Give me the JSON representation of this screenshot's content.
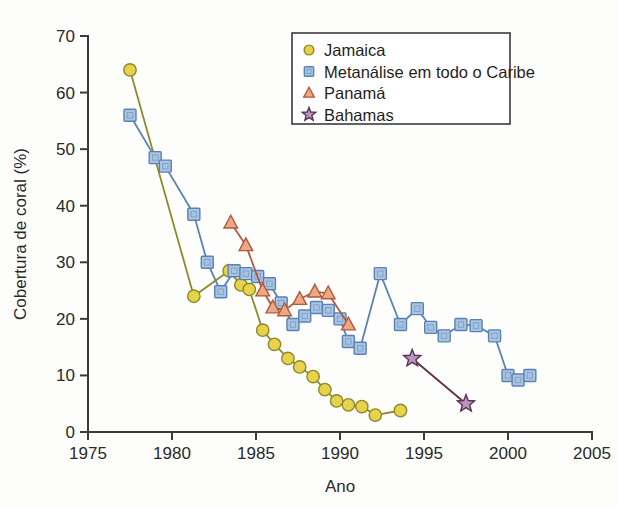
{
  "chart_data": {
    "type": "line",
    "title": "",
    "xlabel": "Ano",
    "ylabel": "Cobertura de coral (%)",
    "xlim": [
      1975,
      2005
    ],
    "ylim": [
      0,
      70
    ],
    "xticks": [
      1975,
      1980,
      1985,
      1990,
      1995,
      2000,
      2005
    ],
    "yticks": [
      0,
      10,
      20,
      30,
      40,
      50,
      60,
      70
    ],
    "grid": false,
    "legend_position": "top-right",
    "series": [
      {
        "name": "Jamaica",
        "marker": "circle",
        "color": "#e8d24a",
        "line_color": "#8d8a2a",
        "points": [
          [
            1977.5,
            64.0
          ],
          [
            1981.3,
            24.0
          ],
          [
            1983.4,
            28.5
          ],
          [
            1984.1,
            26.0
          ],
          [
            1984.6,
            25.2
          ],
          [
            1985.4,
            18.0
          ],
          [
            1986.1,
            15.5
          ],
          [
            1986.9,
            13.0
          ],
          [
            1987.6,
            11.5
          ],
          [
            1988.4,
            9.8
          ],
          [
            1989.1,
            7.5
          ],
          [
            1989.8,
            5.5
          ],
          [
            1990.5,
            4.8
          ],
          [
            1991.3,
            4.5
          ],
          [
            1992.1,
            3.0
          ],
          [
            1993.6,
            3.8
          ]
        ]
      },
      {
        "name": "Metanálise em todo o Caribe",
        "marker": "square",
        "color": "#a8c4e0",
        "line_color": "#5b82b5",
        "points": [
          [
            1977.5,
            56.0
          ],
          [
            1979.0,
            48.5
          ],
          [
            1979.6,
            47.0
          ],
          [
            1981.3,
            38.5
          ],
          [
            1982.1,
            30.0
          ],
          [
            1982.9,
            24.8
          ],
          [
            1983.7,
            28.5
          ],
          [
            1984.4,
            28.0
          ],
          [
            1985.1,
            27.5
          ],
          [
            1985.8,
            26.2
          ],
          [
            1986.5,
            22.8
          ],
          [
            1987.2,
            19.0
          ],
          [
            1987.9,
            20.5
          ],
          [
            1988.6,
            22.0
          ],
          [
            1989.3,
            21.5
          ],
          [
            1990.0,
            20.0
          ],
          [
            1990.5,
            16.0
          ],
          [
            1991.2,
            14.8
          ],
          [
            1992.4,
            28.0
          ],
          [
            1993.6,
            19.0
          ],
          [
            1994.6,
            21.8
          ],
          [
            1995.4,
            18.5
          ],
          [
            1996.2,
            17.0
          ],
          [
            1997.2,
            19.0
          ],
          [
            1998.1,
            18.8
          ],
          [
            1999.2,
            17.0
          ],
          [
            2000.0,
            10.0
          ],
          [
            2000.6,
            9.2
          ],
          [
            2001.3,
            10.0
          ]
        ]
      },
      {
        "name": "Panamá",
        "marker": "triangle",
        "color": "#eba882",
        "line_color": "#b0593f",
        "points": [
          [
            1983.5,
            37.0
          ],
          [
            1984.4,
            33.0
          ],
          [
            1985.4,
            25.0
          ],
          [
            1986.0,
            22.0
          ],
          [
            1986.7,
            21.5
          ],
          [
            1987.6,
            23.5
          ],
          [
            1988.5,
            24.8
          ],
          [
            1989.3,
            24.5
          ],
          [
            1990.5,
            19.0
          ]
        ]
      },
      {
        "name": "Bahamas",
        "marker": "star",
        "color": "#b697c0",
        "line_color": "#5b3250",
        "points": [
          [
            1994.3,
            13.0
          ],
          [
            1997.5,
            5.0
          ]
        ]
      }
    ]
  },
  "legend": {
    "entries": [
      {
        "label": "Jamaica"
      },
      {
        "label": "Metanálise em todo o Caribe"
      },
      {
        "label": "Panamá"
      },
      {
        "label": "Bahamas"
      }
    ]
  }
}
